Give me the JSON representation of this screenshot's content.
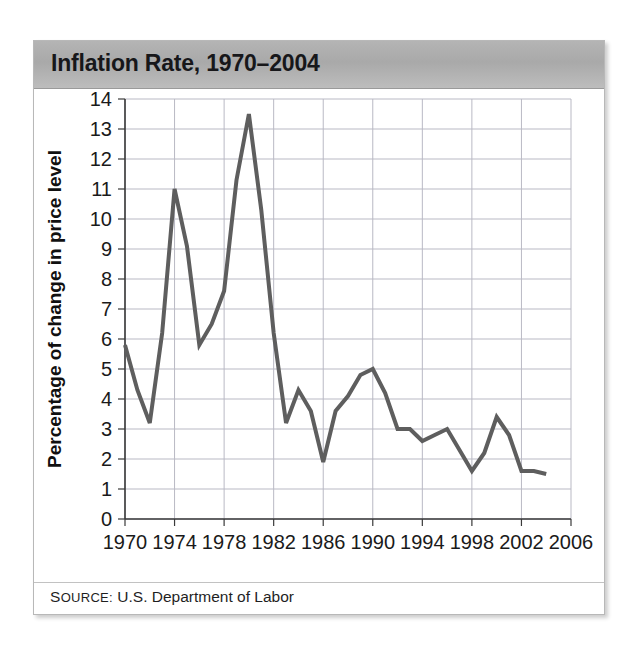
{
  "figure": {
    "title": "Inflation Rate, 1970–2004",
    "source_label": "S",
    "source_label_rest": "OURCE",
    "source_colon": ":",
    "source_value": "U.S. Department of Labor",
    "source_full": "SOURCE: U.S. Department of Labor"
  },
  "colors": {
    "title_bar": "#aaaaaa",
    "line": "#5e5e5e",
    "grid": "#b9b9c4",
    "axis": "#3a3a3a",
    "text": "#1a1a1a",
    "frame": "#b8b8b8"
  },
  "chart_data": {
    "type": "line",
    "title": "Inflation Rate, 1970–2004",
    "xlabel": "",
    "ylabel": "Percentage of change in price level",
    "xlim": [
      1970,
      2006
    ],
    "ylim": [
      0,
      14
    ],
    "xticks": [
      1970,
      1974,
      1978,
      1982,
      1986,
      1990,
      1994,
      1998,
      2002,
      2006
    ],
    "xtick_labels": [
      "1970",
      "1974",
      "1978",
      "1982",
      "1986",
      "1990",
      "1994",
      "1998",
      "2002",
      "2006"
    ],
    "yticks": [
      0,
      1,
      2,
      3,
      4,
      5,
      6,
      7,
      8,
      9,
      10,
      11,
      12,
      13,
      14
    ],
    "ytick_labels": [
      "0",
      "1",
      "2",
      "3",
      "4",
      "5",
      "6",
      "7",
      "8",
      "9",
      "10",
      "11",
      "12",
      "13",
      "14"
    ],
    "grid": true,
    "legend": "none",
    "series": [
      {
        "name": "Inflation rate",
        "color": "#5e5e5e",
        "x": [
          1970,
          1971,
          1972,
          1973,
          1974,
          1975,
          1976,
          1977,
          1978,
          1979,
          1980,
          1981,
          1982,
          1983,
          1984,
          1985,
          1986,
          1987,
          1988,
          1989,
          1990,
          1991,
          1992,
          1993,
          1994,
          1995,
          1996,
          1997,
          1998,
          1999,
          2000,
          2001,
          2002,
          2003,
          2004
        ],
        "y": [
          5.8,
          4.3,
          3.2,
          6.2,
          11.0,
          9.1,
          5.8,
          6.5,
          7.6,
          11.3,
          13.5,
          10.3,
          6.2,
          3.2,
          4.3,
          3.6,
          1.9,
          3.6,
          4.1,
          4.8,
          5.0,
          4.2,
          3.0,
          3.0,
          2.6,
          2.8,
          3.0,
          2.3,
          1.6,
          2.2,
          3.4,
          2.8,
          1.6,
          1.6,
          1.5
        ]
      }
    ]
  }
}
